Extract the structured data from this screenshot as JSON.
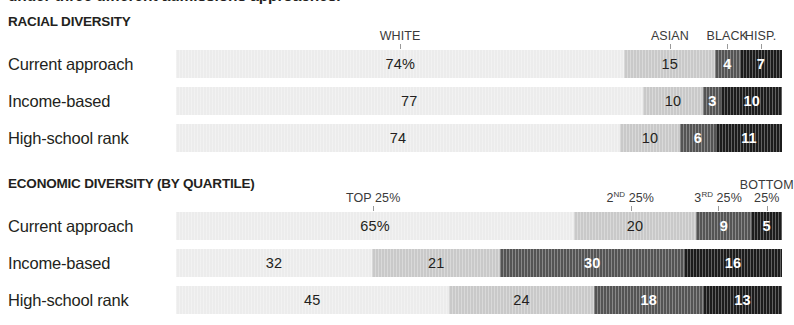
{
  "headline": "under three different admissions approaches.",
  "geometry": {
    "bar_left": 176,
    "bar_width": 606
  },
  "palette": {
    "seg1": "#ececec",
    "seg2": "#c9c9c9",
    "seg3": "#545454",
    "seg4": "#1c1c1c",
    "tick": "#9a9a9a",
    "text_dark": "#231f20",
    "text_light": "#ffffff",
    "header_text": "#3a3a3a"
  },
  "chart_data": [
    {
      "type": "bar",
      "title": "RACIAL DIVERSITY",
      "orientation": "horizontal",
      "stacked": true,
      "unit": "percent",
      "xlim": [
        0,
        100
      ],
      "grid": false,
      "legend_position": "top",
      "categories": [
        "Current approach",
        "Income-based",
        "High-school rank"
      ],
      "legend": [
        {
          "label": "WHITE",
          "label_line2": "",
          "color": "#ececec"
        },
        {
          "label": "ASIAN",
          "label_line2": "",
          "color": "#c9c9c9"
        },
        {
          "label": "BLACK",
          "label_line2": "",
          "color": "#545454"
        },
        {
          "label": "HISP.",
          "label_line2": "",
          "color": "#1c1c1c"
        }
      ],
      "series": [
        {
          "name": "WHITE",
          "values": [
            74,
            77,
            74
          ]
        },
        {
          "name": "ASIAN",
          "values": [
            15,
            10,
            10
          ]
        },
        {
          "name": "BLACK",
          "values": [
            4,
            3,
            6
          ]
        },
        {
          "name": "HISP.",
          "values": [
            7,
            10,
            11
          ]
        }
      ],
      "rows": [
        {
          "label": "Current approach",
          "segments": [
            {
              "value": 74,
              "display": "74%",
              "color": "#ececec",
              "text": "#231f20",
              "bold": false
            },
            {
              "value": 15,
              "display": "15",
              "color": "#c9c9c9",
              "text": "#231f20",
              "bold": false
            },
            {
              "value": 4,
              "display": "4",
              "color": "#545454",
              "text": "#ffffff",
              "bold": true
            },
            {
              "value": 7,
              "display": "7",
              "color": "#1c1c1c",
              "text": "#ffffff",
              "bold": true
            }
          ]
        },
        {
          "label": "Income-based",
          "segments": [
            {
              "value": 77,
              "display": "77",
              "color": "#ececec",
              "text": "#231f20",
              "bold": false
            },
            {
              "value": 10,
              "display": "10",
              "color": "#c9c9c9",
              "text": "#231f20",
              "bold": false
            },
            {
              "value": 3,
              "display": "3",
              "color": "#545454",
              "text": "#ffffff",
              "bold": true
            },
            {
              "value": 10,
              "display": "10",
              "color": "#1c1c1c",
              "text": "#ffffff",
              "bold": true
            }
          ]
        },
        {
          "label": "High-school rank",
          "segments": [
            {
              "value": 74,
              "display": "74",
              "color": "#ececec",
              "text": "#231f20",
              "bold": false
            },
            {
              "value": 10,
              "display": "10",
              "color": "#c9c9c9",
              "text": "#231f20",
              "bold": false
            },
            {
              "value": 6,
              "display": "6",
              "color": "#545454",
              "text": "#ffffff",
              "bold": true
            },
            {
              "value": 11,
              "display": "11",
              "color": "#1c1c1c",
              "text": "#ffffff",
              "bold": true
            }
          ]
        }
      ],
      "header_labels": [
        {
          "text": "WHITE",
          "sup": "",
          "line2": "",
          "tick_at": 37,
          "align": "center"
        },
        {
          "text": "ASIAN",
          "sup": "",
          "line2": "",
          "tick_at": 81.5,
          "align": "center"
        },
        {
          "text": "BLACK",
          "sup": "",
          "line2": "",
          "tick_at": 91,
          "align": "center"
        },
        {
          "text": "HISP.",
          "sup": "",
          "line2": "",
          "tick_at": 96.5,
          "align": "center"
        }
      ]
    },
    {
      "type": "bar",
      "title": "ECONOMIC DIVERSITY (BY QUARTILE)",
      "orientation": "horizontal",
      "stacked": true,
      "unit": "percent",
      "xlim": [
        0,
        100
      ],
      "grid": false,
      "legend_position": "top",
      "categories": [
        "Current approach",
        "Income-based",
        "High-school rank"
      ],
      "legend": [
        {
          "label": "TOP 25%",
          "label_line2": "",
          "color": "#ececec"
        },
        {
          "label": "2ND 25%",
          "label_line2": "",
          "color": "#c9c9c9"
        },
        {
          "label": "3RD 25%",
          "label_line2": "",
          "color": "#545454"
        },
        {
          "label": "BOTTOM 25%",
          "label_line2": "",
          "color": "#1c1c1c"
        }
      ],
      "series": [
        {
          "name": "TOP 25%",
          "values": [
            65,
            32,
            45
          ]
        },
        {
          "name": "2ND 25%",
          "values": [
            20,
            21,
            24
          ]
        },
        {
          "name": "3RD 25%",
          "values": [
            9,
            30,
            18
          ]
        },
        {
          "name": "BOTTOM 25%",
          "values": [
            5,
            16,
            13
          ]
        }
      ],
      "rows": [
        {
          "label": "Current approach",
          "segments": [
            {
              "value": 65,
              "display": "65%",
              "color": "#ececec",
              "text": "#231f20",
              "bold": false
            },
            {
              "value": 20,
              "display": "20",
              "color": "#c9c9c9",
              "text": "#231f20",
              "bold": false
            },
            {
              "value": 9,
              "display": "9",
              "color": "#545454",
              "text": "#ffffff",
              "bold": true
            },
            {
              "value": 5,
              "display": "5",
              "color": "#1c1c1c",
              "text": "#ffffff",
              "bold": true
            }
          ]
        },
        {
          "label": "Income-based",
          "segments": [
            {
              "value": 32,
              "display": "32",
              "color": "#ececec",
              "text": "#231f20",
              "bold": false
            },
            {
              "value": 21,
              "display": "21",
              "color": "#c9c9c9",
              "text": "#231f20",
              "bold": false
            },
            {
              "value": 30,
              "display": "30",
              "color": "#545454",
              "text": "#ffffff",
              "bold": true
            },
            {
              "value": 16,
              "display": "16",
              "color": "#1c1c1c",
              "text": "#ffffff",
              "bold": true
            }
          ]
        },
        {
          "label": "High-school rank",
          "segments": [
            {
              "value": 45,
              "display": "45",
              "color": "#ececec",
              "text": "#231f20",
              "bold": false
            },
            {
              "value": 24,
              "display": "24",
              "color": "#c9c9c9",
              "text": "#231f20",
              "bold": false
            },
            {
              "value": 18,
              "display": "18",
              "color": "#545454",
              "text": "#ffffff",
              "bold": true
            },
            {
              "value": 13,
              "display": "13",
              "color": "#1c1c1c",
              "text": "#ffffff",
              "bold": true
            }
          ]
        }
      ],
      "header_labels": [
        {
          "text": "TOP 25%",
          "sup": "",
          "line2": "",
          "tick_at": 32.5,
          "align": "center"
        },
        {
          "text": " 25%",
          "sup": "2ND",
          "line2": "",
          "tick_at": 75,
          "align": "center"
        },
        {
          "text": " 25%",
          "sup": "3RD",
          "line2": "",
          "tick_at": 89.5,
          "align": "center"
        },
        {
          "text": "25%",
          "sup": "",
          "line2": "BOTTOM",
          "tick_at": 97.5,
          "align": "center"
        }
      ]
    }
  ]
}
